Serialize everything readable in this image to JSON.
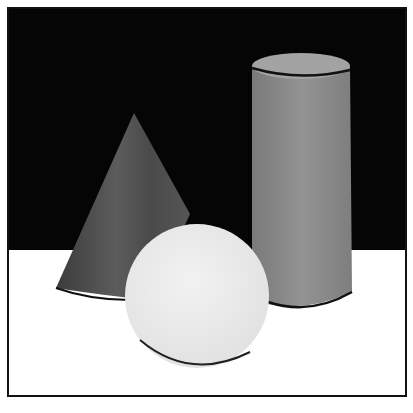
{
  "image": {
    "caption": "Ink wash still life: a cone, a sphere and a cylinder on a white table against a black background",
    "objects": [
      "cone",
      "sphere",
      "cylinder"
    ],
    "colors": {
      "background": "#050505",
      "table": "#ffffff",
      "cone": "#555555",
      "cone_dark": "#3a3a3a",
      "sphere": "#ececec",
      "cylinder": "#8a8a8a",
      "cylinder_top": "#a0a0a0",
      "outline": "#111111"
    }
  }
}
